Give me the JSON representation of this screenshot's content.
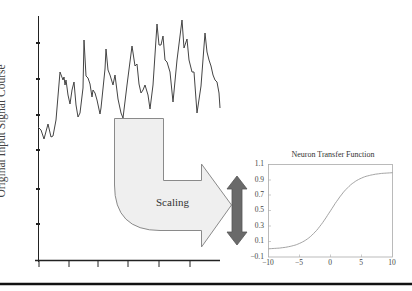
{
  "left_panel": {
    "ylabel": "Original Input Signal Course",
    "signal_points": [
      [
        38,
        127
      ],
      [
        41,
        130
      ],
      [
        44,
        139
      ],
      [
        48,
        124
      ],
      [
        51,
        137
      ],
      [
        53,
        136
      ],
      [
        56,
        120
      ],
      [
        60,
        72
      ],
      [
        63,
        80
      ],
      [
        64,
        77
      ],
      [
        65,
        85
      ],
      [
        66,
        80
      ],
      [
        68,
        95
      ],
      [
        70,
        104
      ],
      [
        72,
        90
      ],
      [
        74,
        82
      ],
      [
        76,
        105
      ],
      [
        78,
        117
      ],
      [
        80,
        113
      ],
      [
        83,
        88
      ],
      [
        84,
        40
      ],
      [
        86,
        76
      ],
      [
        88,
        78
      ],
      [
        90,
        84
      ],
      [
        92,
        97
      ],
      [
        93,
        90
      ],
      [
        95,
        93
      ],
      [
        97,
        100
      ],
      [
        100,
        114
      ],
      [
        101,
        108
      ],
      [
        105,
        69
      ],
      [
        106,
        49
      ],
      [
        108,
        70
      ],
      [
        110,
        75
      ],
      [
        113,
        85
      ],
      [
        115,
        75
      ],
      [
        118,
        99
      ],
      [
        121,
        113
      ],
      [
        123,
        118
      ],
      [
        127,
        85
      ],
      [
        132,
        46
      ],
      [
        135,
        66
      ],
      [
        137,
        64
      ],
      [
        139,
        84
      ],
      [
        141,
        93
      ],
      [
        143,
        90
      ],
      [
        145,
        85
      ],
      [
        148,
        95
      ],
      [
        150,
        109
      ],
      [
        153,
        85
      ],
      [
        157,
        24
      ],
      [
        159,
        45
      ],
      [
        161,
        45
      ],
      [
        163,
        36
      ],
      [
        165,
        60
      ],
      [
        167,
        62
      ],
      [
        170,
        72
      ],
      [
        173,
        102
      ],
      [
        177,
        60
      ],
      [
        182,
        20
      ],
      [
        184,
        48
      ],
      [
        187,
        39
      ],
      [
        189,
        60
      ],
      [
        192,
        72
      ],
      [
        194,
        72
      ],
      [
        197,
        113
      ],
      [
        201,
        86
      ],
      [
        205,
        33
      ],
      [
        207,
        52
      ],
      [
        209,
        60
      ],
      [
        211,
        66
      ],
      [
        213,
        75
      ],
      [
        215,
        80
      ],
      [
        217,
        82
      ],
      [
        219,
        93
      ],
      [
        220,
        108
      ]
    ]
  },
  "arrow": {
    "label": "Scaling"
  },
  "chart_data": {
    "type": "line",
    "title": "Neuron Transfer Function",
    "xlabel": "",
    "ylabel": "",
    "x_ticks": [
      "−10",
      "−5",
      "0",
      "5",
      "10"
    ],
    "y_ticks": [
      "1.1",
      "0.9",
      "0.7",
      "0.5",
      "0.3",
      "0.1",
      "−0.1"
    ],
    "xlim": [
      -10,
      10
    ],
    "ylim": [
      -0.1,
      1.1
    ],
    "grid": false,
    "function": "sigmoid 1/(1+exp(-0.5x))",
    "series": [
      {
        "name": "transfer",
        "x": [
          -10,
          -8,
          -6,
          -4,
          -2,
          0,
          2,
          4,
          6,
          8,
          10
        ],
        "y": [
          0.007,
          0.018,
          0.047,
          0.119,
          0.269,
          0.5,
          0.731,
          0.881,
          0.953,
          0.982,
          0.993
        ]
      }
    ]
  }
}
